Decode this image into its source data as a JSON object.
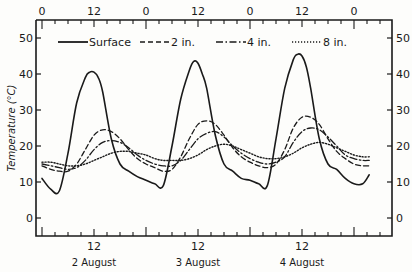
{
  "chart_data": {
    "type": "line",
    "title": "",
    "xlabel": "",
    "ylabel": "Temperature (°C)",
    "ylim": [
      -5,
      55
    ],
    "yticks": [
      0,
      10,
      20,
      30,
      40,
      50
    ],
    "xlim_hours": [
      -1.5,
      80.5
    ],
    "top_axis_ticks": [
      {
        "hour": 0,
        "label": "0"
      },
      {
        "hour": 12,
        "label": "12"
      },
      {
        "hour": 24,
        "label": "0"
      },
      {
        "hour": 36,
        "label": "12"
      },
      {
        "hour": 48,
        "label": "0"
      },
      {
        "hour": 60,
        "label": "12"
      },
      {
        "hour": 72,
        "label": "0"
      }
    ],
    "bottom_axis_ticks": [
      {
        "hour": 12,
        "label": "12"
      },
      {
        "hour": 36,
        "label": "12"
      },
      {
        "hour": 60,
        "label": "12"
      }
    ],
    "date_labels": [
      {
        "hour": 12,
        "label": "2 August"
      },
      {
        "hour": 36,
        "label": "3 August"
      },
      {
        "hour": 60,
        "label": "4 August"
      }
    ],
    "grid": false,
    "legend_position": "top-inside",
    "series": [
      {
        "name": "Surface",
        "style": "solid",
        "x": [
          0,
          2,
          4,
          6,
          8,
          10,
          11,
          12,
          13,
          14,
          16,
          18,
          20,
          22,
          24,
          26,
          28,
          30,
          32,
          34,
          35,
          36,
          37,
          38,
          40,
          42,
          44,
          46,
          48,
          50,
          52,
          54,
          56,
          58,
          59,
          60,
          61,
          62,
          64,
          66,
          68,
          70,
          72,
          74,
          75.5
        ],
        "y": [
          11,
          8,
          7.5,
          18,
          32,
          39,
          40.5,
          40.5,
          39,
          35,
          22,
          15,
          13,
          11.5,
          10.5,
          9.5,
          9,
          20,
          33,
          41,
          43.5,
          43,
          40,
          36,
          23,
          15,
          13,
          11,
          10.5,
          9.5,
          9,
          22,
          36,
          44,
          45.5,
          45,
          42,
          36,
          22,
          15,
          13.5,
          11,
          9.5,
          9.5,
          12
        ]
      },
      {
        "name": "2 in.",
        "style": "dashed",
        "x": [
          0,
          2,
          4,
          6,
          8,
          10,
          12,
          14,
          16,
          18,
          20,
          22,
          24,
          26,
          28,
          30,
          32,
          34,
          36,
          38,
          40,
          42,
          44,
          46,
          48,
          50,
          52,
          54,
          56,
          58,
          60,
          62,
          64,
          66,
          68,
          70,
          72,
          74,
          75.5
        ],
        "y": [
          14.5,
          13.5,
          13,
          13,
          15,
          19,
          23,
          24.5,
          24,
          22,
          19,
          16.5,
          15,
          14,
          13,
          13.5,
          17,
          22,
          26,
          27,
          26,
          23,
          19.5,
          17,
          15.5,
          14.5,
          14,
          15,
          19,
          25,
          28,
          28,
          26,
          22,
          18.5,
          16.5,
          15,
          14.5,
          14.5
        ]
      },
      {
        "name": "4 in.",
        "style": "dash-dot",
        "x": [
          0,
          2,
          4,
          6,
          8,
          10,
          12,
          14,
          16,
          18,
          20,
          22,
          24,
          26,
          28,
          30,
          32,
          34,
          36,
          38,
          40,
          42,
          44,
          46,
          48,
          50,
          52,
          54,
          56,
          58,
          60,
          62,
          64,
          66,
          68,
          70,
          72,
          74,
          75.5
        ],
        "y": [
          15,
          14.5,
          14,
          13.5,
          14,
          16,
          19,
          21,
          21.5,
          21,
          19.5,
          17.5,
          16,
          15,
          14.5,
          14.5,
          16,
          19,
          22,
          23.5,
          24,
          22.5,
          20,
          18,
          16.5,
          15.5,
          15,
          15.5,
          17,
          21,
          24,
          25,
          24.5,
          22.5,
          20,
          17.5,
          16.5,
          16,
          16
        ]
      },
      {
        "name": "8 in.",
        "style": "dotted",
        "x": [
          0,
          2,
          4,
          6,
          8,
          10,
          12,
          14,
          16,
          18,
          20,
          22,
          24,
          26,
          28,
          30,
          32,
          34,
          36,
          38,
          40,
          42,
          44,
          46,
          48,
          50,
          52,
          54,
          56,
          58,
          60,
          62,
          64,
          66,
          68,
          70,
          72,
          74,
          75.5
        ],
        "y": [
          15.5,
          15.5,
          15,
          14.5,
          14.5,
          15,
          16,
          17,
          18,
          18.5,
          18.5,
          18,
          17.5,
          16.5,
          16,
          16,
          16,
          16.5,
          17.5,
          19,
          20,
          20.5,
          20,
          19,
          18,
          17,
          16.5,
          16.5,
          17,
          18,
          19.5,
          20.5,
          21,
          20.5,
          19.5,
          18.5,
          17.5,
          17,
          17
        ]
      }
    ]
  },
  "legend": {
    "items": [
      {
        "label": "Surface",
        "style": "solid"
      },
      {
        "label": "2 in.",
        "style": "dashed"
      },
      {
        "label": "4 in.",
        "style": "dash-dot"
      },
      {
        "label": "8 in.",
        "style": "dotted"
      }
    ]
  },
  "colors": {
    "ink": "#1a1a1a",
    "paper": "#fdfdfb"
  }
}
